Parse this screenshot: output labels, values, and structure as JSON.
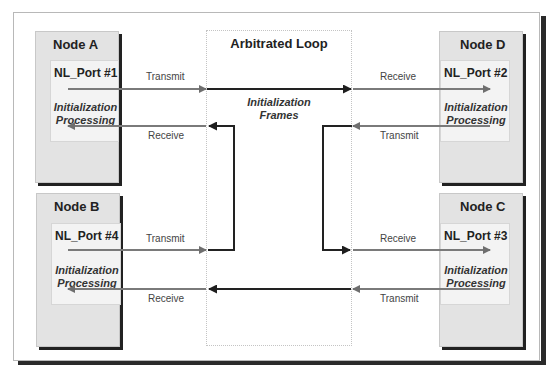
{
  "loop": {
    "title": "Arbitrated Loop",
    "frames_label_1": "Initialization",
    "frames_label_2": "Frames"
  },
  "nodes": [
    {
      "name": "Node A",
      "port": "NL_Port #1",
      "proc1": "Initialization",
      "proc2": "Processing"
    },
    {
      "name": "Node D",
      "port": "NL_Port #2",
      "proc1": "Initialization",
      "proc2": "Processing"
    },
    {
      "name": "Node B",
      "port": "NL_Port #4",
      "proc1": "Initialization",
      "proc2": "Processing"
    },
    {
      "name": "Node C",
      "port": "NL_Port #3",
      "proc1": "Initialization",
      "proc2": "Processing"
    }
  ],
  "labels": {
    "a_transmit": "Transmit",
    "a_receive": "Receive",
    "d_receive": "Receive",
    "d_transmit": "Transmit",
    "b_transmit": "Transmit",
    "b_receive": "Receive",
    "c_receive": "Receive",
    "c_transmit": "Transmit"
  },
  "colors": {
    "loop_line": "#222222",
    "link_line": "#7a7a7a",
    "node_fill": "#e3e3e3",
    "port_fill": "#f3f3f3"
  }
}
